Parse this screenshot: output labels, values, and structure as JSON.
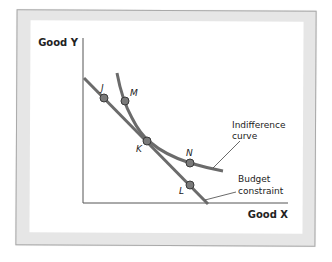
{
  "diagram": {
    "axes": {
      "y_label": "Good Y",
      "x_label": "Good X"
    },
    "points": [
      {
        "id": "J",
        "label": "J",
        "on": "budget constraint"
      },
      {
        "id": "M",
        "label": "M",
        "on": "indifference curve"
      },
      {
        "id": "K",
        "label": "K",
        "on": "both (tangency)"
      },
      {
        "id": "N",
        "label": "N",
        "on": "indifference curve"
      },
      {
        "id": "L",
        "label": "L",
        "on": "budget constraint"
      }
    ],
    "annotations": {
      "indifference_line1": "Indifference",
      "indifference_line2": "curve",
      "budget_line1": "Budget",
      "budget_line2": "constraint"
    },
    "colors": {
      "curve": "#6b6b6b",
      "point_fill": "#7a7a7a",
      "point_stroke": "#3a3a3a",
      "axis": "#555555",
      "frame": "#e6e6e6"
    }
  }
}
